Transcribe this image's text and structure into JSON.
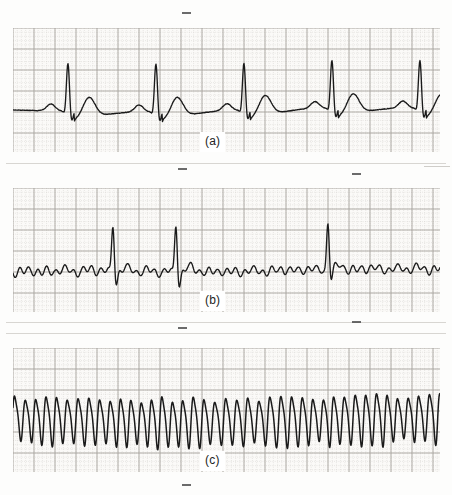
{
  "figure": {
    "kind": "ecg-rhythm-strips",
    "background_color": "#fdfdfc",
    "paper_color": "#fbfaf8",
    "trace_color": "#1a1a1a",
    "grid_major_color": "#8f8b86",
    "grid_minor_color": "#bdb9b4",
    "panel_count": 3
  },
  "panels": [
    {
      "id": "panel-a",
      "caption": "(a)",
      "caption_left": 200,
      "caption_top": 132,
      "rhythm_name": "normal sinus rhythm",
      "x": 13,
      "y": 28,
      "width": 427,
      "height": 124,
      "grid": {
        "major_px": 21.0,
        "minor_px": 4.2,
        "minor_style": "dotted",
        "major_style": "solid"
      },
      "baseline_y": 82,
      "baseline_drift": 2.0,
      "beats": [
        {
          "r_x": 55,
          "p_amp": 7,
          "r_amp": 50,
          "s_amp": 12,
          "t_amp": 20
        },
        {
          "r_x": 143,
          "p_amp": 7,
          "r_amp": 50,
          "s_amp": 12,
          "t_amp": 20
        },
        {
          "r_x": 231,
          "p_amp": 7,
          "r_amp": 49,
          "s_amp": 12,
          "t_amp": 20
        },
        {
          "r_x": 319,
          "p_amp": 7,
          "r_amp": 50,
          "s_amp": 12,
          "t_amp": 20
        },
        {
          "r_x": 407,
          "p_amp": 7,
          "r_amp": 50,
          "s_amp": 12,
          "t_amp": 20
        }
      ],
      "rr_interval_px": 88
    },
    {
      "id": "panel-b",
      "caption": "(b)",
      "caption_left": 200,
      "caption_top": 291,
      "rhythm_name": "atrial fibrillation",
      "x": 13,
      "y": 188,
      "width": 427,
      "height": 124,
      "grid": {
        "major_px": 21.0,
        "minor_px": 4.2,
        "minor_style": "dotted",
        "major_style": "solid"
      },
      "baseline_y": 82,
      "fib_wave_amplitude": 4.5,
      "fib_wave_period_px": 9,
      "beats": [
        {
          "r_x": 100,
          "r_amp": 48,
          "s_amp": 14
        },
        {
          "r_x": 163,
          "r_amp": 50,
          "s_amp": 16
        },
        {
          "r_x": 315,
          "r_amp": 48,
          "s_amp": 12
        },
        {
          "r_x": 434,
          "r_amp": 47,
          "s_amp": 14
        }
      ]
    },
    {
      "id": "panel-c",
      "caption": "(c)",
      "caption_left": 200,
      "caption_top": 451,
      "rhythm_name": "ventricular flutter",
      "x": 13,
      "y": 348,
      "width": 427,
      "height": 124,
      "grid": {
        "major_px": 21.0,
        "minor_px": 4.2,
        "minor_style": "dotted",
        "major_style": "solid"
      },
      "baseline_y": 70,
      "oscillation_period_px": 10.6,
      "oscillation_amplitude": 22,
      "oscillation_amplitude_variation": 7
    }
  ],
  "edge_ticks": [
    {
      "name": "tick-top",
      "left": 182,
      "top": 12,
      "width": 9
    },
    {
      "name": "tick-a-bottom",
      "left": 178,
      "top": 168,
      "width": 9
    },
    {
      "name": "tick-a-right",
      "left": 352,
      "top": 173,
      "width": 9
    },
    {
      "name": "tick-b-bottom",
      "left": 178,
      "top": 327,
      "width": 9
    },
    {
      "name": "tick-b-right",
      "left": 352,
      "top": 321,
      "width": 9
    },
    {
      "name": "tick-c-bottom",
      "left": 182,
      "top": 484,
      "width": 9
    }
  ],
  "separator_rules": [
    {
      "name": "rule-below-a",
      "left": 6,
      "top": 163,
      "width": 440
    },
    {
      "name": "rule-below-b",
      "left": 6,
      "top": 322,
      "width": 440
    },
    {
      "name": "rule-above-c",
      "left": 6,
      "top": 333,
      "width": 440
    }
  ],
  "page_edges": [
    {
      "name": "page-edge-right-top",
      "left": 424,
      "top": 166,
      "width": 26,
      "height": 1
    }
  ]
}
